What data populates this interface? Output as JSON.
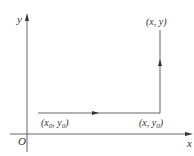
{
  "diagram": {
    "type": "coordinate-path",
    "colors": {
      "axis": "#555555",
      "path": "#555555",
      "text": "#333333",
      "background": "#ffffff"
    },
    "axes": {
      "x_label": "x",
      "y_label": "y",
      "origin_label": "O"
    },
    "points": {
      "start": {
        "label": "(x",
        "sub1": "0",
        "mid": ", y",
        "sub2": "0",
        "end": ")"
      },
      "corner": {
        "label": "(x, y",
        "sub": "0",
        "end": ")"
      },
      "end": {
        "label": "(x, y)"
      }
    },
    "paths": [
      {
        "from": "start",
        "to": "corner",
        "direction": "right"
      },
      {
        "from": "corner",
        "to": "end",
        "direction": "up"
      }
    ]
  }
}
